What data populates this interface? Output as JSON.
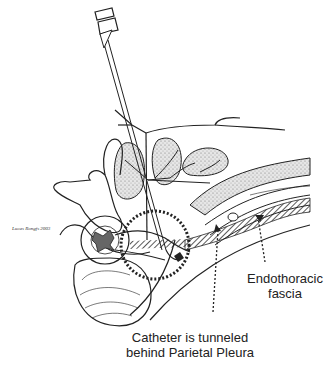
{
  "labels": {
    "endothoracic_line1": "Endothoracic",
    "endothoracic_line2": "fascia",
    "catheter_line1": "Catheter is tunneled",
    "catheter_line2": "behind Parietal Pleura",
    "signature": "Lucas Rongfs 2003"
  },
  "colors": {
    "ink": "#222222",
    "stipple": "#bdbdbd",
    "background": "#ffffff"
  }
}
